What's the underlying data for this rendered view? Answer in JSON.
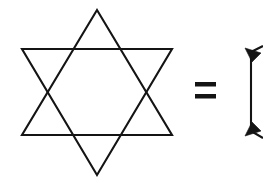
{
  "canvas": {
    "width": 263,
    "height": 181,
    "background_color": "#ffffff",
    "ink_color": "#141414",
    "stroke_width": 2.1
  },
  "figure": {
    "description": "A six-pointed star (hexagram) formed by two overlapping equilateral triangles, followed by an equals sign, followed by a second figure cut off at the right edge of the image."
  },
  "elements": {
    "hexagram": {
      "label": "hexagram",
      "alt_label": "six-pointed star",
      "center": {
        "x": 97,
        "y": 92
      },
      "bounds": {
        "left": 22,
        "top": 10,
        "right": 172,
        "bottom": 175
      },
      "triangle_up": {
        "label": "upward triangle",
        "points": "97,10 172,135 22,135"
      },
      "triangle_down": {
        "label": "downward triangle",
        "points": "97,175 22,49 172,49"
      },
      "outline_points": "97,10 122,49 172,49 147,92 172,135 122,135 97,175 72,135 22,135 47,92 22,49 72,49",
      "vertices": [
        {
          "name": "top-point",
          "x": 97,
          "y": 10
        },
        {
          "name": "upper-right-point",
          "x": 172,
          "y": 49
        },
        {
          "name": "lower-right-point",
          "x": 172,
          "y": 135
        },
        {
          "name": "bottom-point",
          "x": 97,
          "y": 175
        },
        {
          "name": "lower-left-point",
          "x": 22,
          "y": 135
        },
        {
          "name": "upper-left-point",
          "x": 22,
          "y": 49
        }
      ]
    },
    "equals_sign": {
      "label": "=",
      "glyph_name": "equals-sign",
      "bounds": {
        "left": 195,
        "top": 82,
        "right": 216,
        "bottom": 99
      },
      "bar_top": {
        "x": 195,
        "y": 82,
        "width": 21,
        "height": 4.5
      },
      "bar_bottom": {
        "x": 195,
        "y": 94,
        "width": 21,
        "height": 4.5
      }
    },
    "right_fragment": {
      "label": "clipped figure",
      "description": "Left-hand sliver of a second figure, clipped by the image border: a vertical edge with an arrowhead at the top pointing up-left and an arrowhead at the bottom pointing down-left.",
      "vertical_edge": {
        "x": 251,
        "y_top": 52,
        "y_bottom": 131
      },
      "arrow_top": {
        "name": "arrowhead-up-left",
        "tip": {
          "x": 245,
          "y": 48
        },
        "points": "245,48 261,53 252,62"
      },
      "arrow_bottom": {
        "name": "arrowhead-down-left",
        "tip": {
          "x": 245,
          "y": 136
        },
        "points": "245,136 261,131 252,122"
      },
      "top_spur": {
        "x1": 251,
        "y1": 52,
        "x2": 263,
        "y2": 46
      },
      "bottom_spur": {
        "x1": 251,
        "y1": 131,
        "x2": 263,
        "y2": 138
      }
    }
  }
}
